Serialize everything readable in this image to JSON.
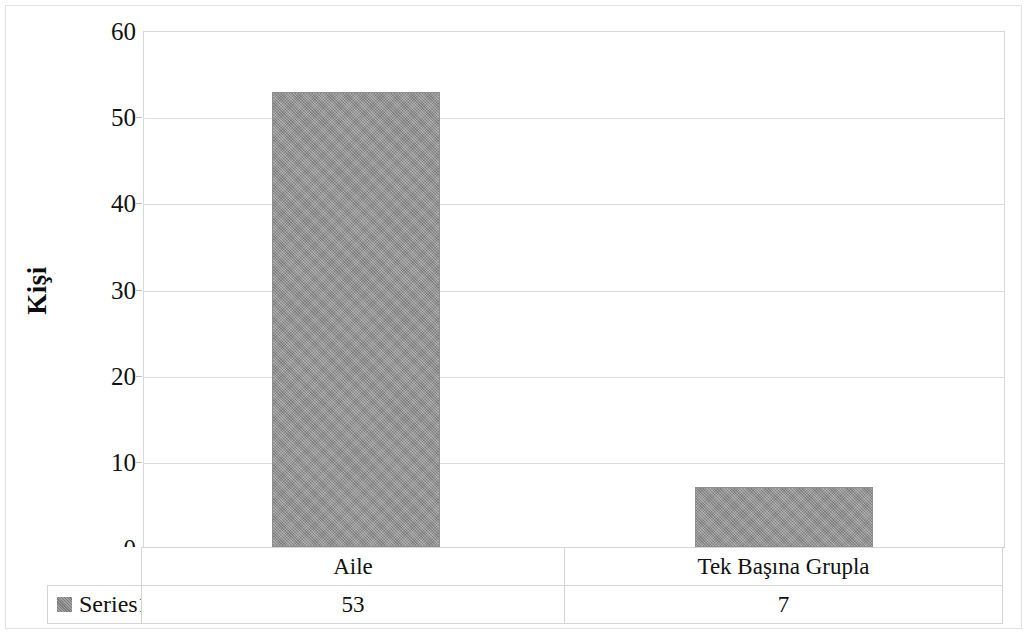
{
  "chart_data": {
    "type": "bar",
    "title": "",
    "subtitle": "",
    "xlabel": "",
    "ylabel": "Kişi",
    "categories": [
      "Aile",
      "Tek Başına Grupla"
    ],
    "series": [
      {
        "name": "Series1",
        "values": [
          53,
          7
        ]
      }
    ],
    "values": [
      53,
      7
    ],
    "ylim": [
      0,
      60
    ],
    "y_ticks": [
      60,
      50,
      40,
      30,
      20,
      10,
      0
    ],
    "y_tick_labels": [
      "60",
      "50",
      "40",
      "30",
      "20",
      "10",
      "0"
    ],
    "grid": true,
    "grid_axis": "y",
    "legend_position": "data-table",
    "data_table_visible": true,
    "bar_color": "#969696",
    "gridline_color": "#dcdcdc",
    "plot_border_color": "#d8d8d8",
    "text_color": "#111111"
  },
  "axis": {
    "y_title": "Kişi",
    "ticks": [
      {
        "label": "60",
        "value": 60
      },
      {
        "label": "50",
        "value": 50
      },
      {
        "label": "40",
        "value": 40
      },
      {
        "label": "30",
        "value": 30
      },
      {
        "label": "20",
        "value": 20
      },
      {
        "label": "10",
        "value": 10
      },
      {
        "label": "0",
        "value": 0
      }
    ]
  },
  "table": {
    "legend_label": "Series1",
    "categories": [
      "Aile",
      "Tek Başına Grupla"
    ],
    "values": [
      "53",
      "7"
    ]
  }
}
